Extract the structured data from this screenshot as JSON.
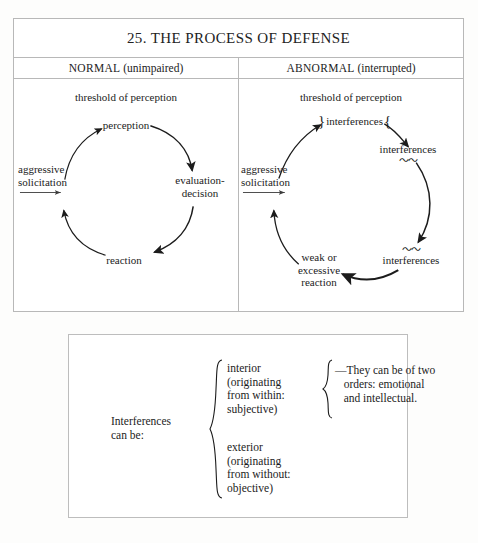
{
  "figure": {
    "title": "25. THE PROCESS OF DEFENSE",
    "columns": [
      {
        "name": "NORMAL",
        "qualifier": "(unimpaired)"
      },
      {
        "name": "ABNORMAL",
        "qualifier": "(interrupted)"
      }
    ]
  },
  "normal_panel": {
    "threshold": "threshold of perception",
    "input": "aggressive\nsolicitation",
    "nodes": [
      {
        "id": "perception",
        "label": "perception"
      },
      {
        "id": "evaluation",
        "label": "evaluation-\ndecision"
      },
      {
        "id": "reaction",
        "label": "reaction"
      }
    ]
  },
  "abnormal_panel": {
    "threshold": "threshold of perception",
    "input": "aggressive\nsolicitation",
    "nodes": [
      {
        "id": "top-interferences",
        "label": "interferences",
        "brace_left": "}",
        "brace_right": "{"
      },
      {
        "id": "right-interferences",
        "label": "interferences",
        "squiggle": "〜〜"
      },
      {
        "id": "lower-interferences",
        "label": "interferences",
        "squiggle": "〜〜"
      },
      {
        "id": "reaction",
        "label": "weak or\nexcessive\nreaction"
      }
    ]
  },
  "definition_box": {
    "lead": "Interferences\ncan be:",
    "brace_outer": "{",
    "brace_inner": "{",
    "items": [
      {
        "id": "interior",
        "label": "interior\n(originating\nfrom within:\nsubjective)"
      },
      {
        "id": "exterior",
        "label": "exterior\n(originating\nfrom without:\nobjective)"
      }
    ],
    "note": "—They can be of two\n   orders: emotional\n   and intellectual."
  },
  "colors": {
    "ink": "#1c1c1c",
    "rule": "#b8b8b8",
    "page": "#fdfdfc"
  }
}
